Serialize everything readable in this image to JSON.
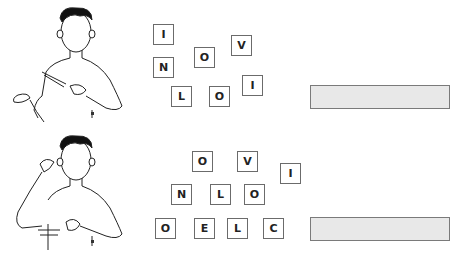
{
  "exercises": [
    {
      "figure": "sign-language-figure-1",
      "tiles": [
        {
          "letter": "I",
          "x": 153,
          "y": 24
        },
        {
          "letter": "O",
          "x": 194,
          "y": 47
        },
        {
          "letter": "V",
          "x": 231,
          "y": 35
        },
        {
          "letter": "N",
          "x": 153,
          "y": 57
        },
        {
          "letter": "L",
          "x": 171,
          "y": 86
        },
        {
          "letter": "O",
          "x": 209,
          "y": 86
        },
        {
          "letter": "I",
          "x": 242,
          "y": 75
        }
      ],
      "answer_box": {
        "x": 310,
        "y": 85,
        "value": ""
      }
    },
    {
      "figure": "sign-language-figure-2",
      "tiles": [
        {
          "letter": "O",
          "x": 192,
          "y": 151
        },
        {
          "letter": "V",
          "x": 237,
          "y": 151
        },
        {
          "letter": "I",
          "x": 280,
          "y": 163
        },
        {
          "letter": "N",
          "x": 171,
          "y": 184
        },
        {
          "letter": "L",
          "x": 210,
          "y": 184
        },
        {
          "letter": "O",
          "x": 244,
          "y": 184
        },
        {
          "letter": "O",
          "x": 155,
          "y": 218
        },
        {
          "letter": "E",
          "x": 194,
          "y": 218
        },
        {
          "letter": "L",
          "x": 227,
          "y": 218
        },
        {
          "letter": "C",
          "x": 263,
          "y": 218
        }
      ],
      "answer_box": {
        "x": 310,
        "y": 217,
        "value": ""
      }
    }
  ]
}
